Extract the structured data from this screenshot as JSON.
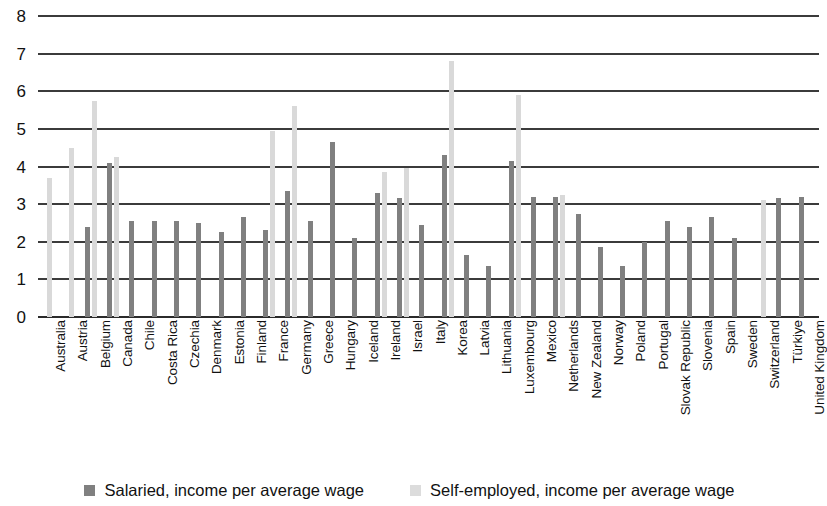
{
  "chart_data": {
    "type": "bar",
    "title": "",
    "subtitle": "",
    "xlabel": "",
    "ylabel": "",
    "ylim": [
      0,
      8
    ],
    "yticks": [
      0,
      1,
      2,
      3,
      4,
      5,
      6,
      7,
      8
    ],
    "grid": true,
    "legend_position": "bottom",
    "colors": {
      "salaried": "#808080",
      "self_employed": "#d9d9d9",
      "gridline": "#3b3b3b",
      "background": "#ffffff",
      "text": "#111111"
    },
    "categories": [
      "Australia",
      "Austria",
      "Belgium",
      "Canada",
      "Chile",
      "Costa Rica",
      "Czechia",
      "Denmark",
      "Estonia",
      "Finland",
      "France",
      "Germany",
      "Greece",
      "Hungary",
      "Iceland",
      "Ireland",
      "Israel",
      "Italy",
      "Korea",
      "Latvia",
      "Lithuania",
      "Luxembourg",
      "Mexico",
      "Netherlands",
      "New Zealand",
      "Norway",
      "Poland",
      "Portugal",
      "Slovak Republic",
      "Slovenia",
      "Spain",
      "Sweden",
      "Switzerland",
      "Türkiye",
      "United Kingdom"
    ],
    "series": [
      {
        "name": "Salaried, income per average wage",
        "color": "#808080",
        "values": [
          null,
          null,
          2.4,
          4.1,
          2.55,
          2.55,
          2.55,
          2.5,
          2.25,
          2.65,
          2.3,
          3.35,
          2.55,
          4.65,
          2.1,
          3.3,
          3.15,
          2.45,
          4.3,
          1.65,
          1.35,
          4.15,
          3.2,
          3.2,
          2.75,
          1.85,
          1.35,
          2.0,
          2.55,
          2.4,
          2.65,
          2.1,
          null,
          3.15,
          3.2
        ]
      },
      {
        "name": "Self-employed, income per average wage",
        "color": "#d9d9d9",
        "values": [
          3.7,
          4.5,
          5.75,
          4.25,
          null,
          null,
          null,
          null,
          null,
          null,
          4.95,
          5.6,
          null,
          null,
          null,
          3.85,
          3.95,
          null,
          6.8,
          null,
          null,
          5.9,
          null,
          3.25,
          null,
          null,
          null,
          null,
          null,
          null,
          null,
          null,
          3.1,
          null,
          null
        ]
      }
    ]
  },
  "legend": {
    "items": [
      {
        "label": "Salaried, income per average wage",
        "swatch": "salaried"
      },
      {
        "label": "Self-employed, income per average wage",
        "swatch": "self"
      }
    ]
  },
  "icons": {
    "legend_swatch_salaried": "square-swatch-icon",
    "legend_swatch_self": "square-swatch-icon"
  }
}
